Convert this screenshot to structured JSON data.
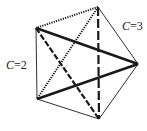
{
  "diagram": {
    "type": "complete-graph-K5",
    "vertices": [
      {
        "id": "A",
        "x": 98,
        "y": 7
      },
      {
        "id": "B",
        "x": 36,
        "y": 28
      },
      {
        "id": "C",
        "x": 138,
        "y": 64
      },
      {
        "id": "D",
        "x": 37,
        "y": 99
      },
      {
        "id": "E",
        "x": 99,
        "y": 119
      }
    ],
    "edges": [
      {
        "from": "A",
        "to": "B",
        "style": "dotted"
      },
      {
        "from": "A",
        "to": "C",
        "style": "thin"
      },
      {
        "from": "A",
        "to": "D",
        "style": "dotted"
      },
      {
        "from": "A",
        "to": "E",
        "style": "long-dash"
      },
      {
        "from": "B",
        "to": "C",
        "style": "thick"
      },
      {
        "from": "B",
        "to": "D",
        "style": "thin"
      },
      {
        "from": "B",
        "to": "E",
        "style": "dash"
      },
      {
        "from": "C",
        "to": "D",
        "style": "thick"
      },
      {
        "from": "C",
        "to": "E",
        "style": "thin"
      },
      {
        "from": "D",
        "to": "E",
        "style": "thin"
      }
    ],
    "labels": [
      {
        "id": "label-c2",
        "var": "C",
        "eq": "=2",
        "x": 6,
        "y": 58
      },
      {
        "id": "label-c3",
        "var": "C",
        "eq": "=3",
        "x": 122,
        "y": 19
      }
    ],
    "line_color": "#1a1a1a"
  }
}
